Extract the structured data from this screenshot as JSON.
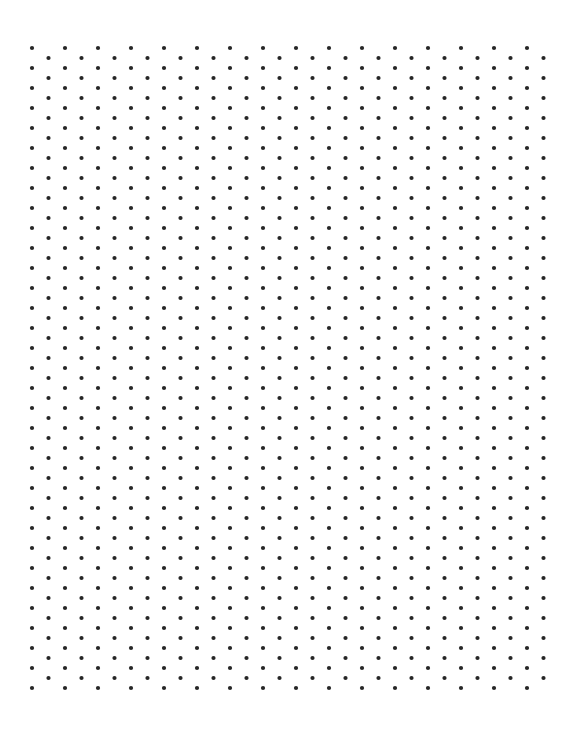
{
  "page": {
    "width": 583,
    "height": 756,
    "background_color": "#ffffff",
    "orientation": "portrait"
  },
  "grid": {
    "name": "triangular-dot-grid",
    "dot_color": "#262626",
    "dot_radius": 2.1,
    "dot_shape": "circle",
    "origin_x": 32,
    "origin_y": 48,
    "column_step_x": 16.5,
    "row_step_y": 20,
    "stagger_offset_y": 10,
    "columns": 32,
    "rows_primary": 33,
    "rows_offset": 33,
    "right_edge_x": 545.5,
    "bottom_edge_y": 688,
    "total_dots": 1056
  },
  "chart_data": {
    "type": "scatter",
    "xlabel": "",
    "ylabel": "",
    "xlim": [
      32,
      545.5
    ],
    "ylim": [
      48,
      688
    ],
    "grid": false,
    "legend": "none",
    "lattice": "triangular",
    "series": [
      {
        "name": "primary-columns",
        "description": "Even-indexed columns starting at x=32, y=48, spaced 33px horizontally and 20px vertically",
        "start_x": 32,
        "start_y": 48,
        "dx": 33,
        "dy": 20,
        "count_x": 16,
        "count_y": 33
      },
      {
        "name": "offset-columns",
        "description": "Odd-indexed columns starting at x=48.5, y=58, staggered 10px down",
        "start_x": 48.5,
        "start_y": 58,
        "dx": 33,
        "dy": 20,
        "count_x": 16,
        "count_y": 32
      }
    ]
  }
}
